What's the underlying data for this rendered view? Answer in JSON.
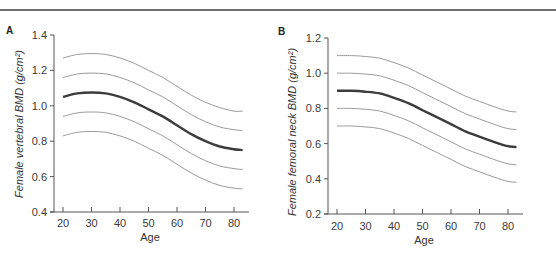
{
  "chart_data": [
    {
      "panel": "A",
      "type": "line",
      "title": "",
      "xlabel": "Age",
      "ylabel": "Female vertebral BMD (g/cm²)",
      "xlim": [
        17,
        85
      ],
      "ylim": [
        0.4,
        1.4
      ],
      "x_ticks": [
        20,
        30,
        40,
        50,
        60,
        70,
        80
      ],
      "y_ticks": [
        "0.4",
        "0.6",
        "0.8",
        "1.0",
        "1.2",
        "1.4"
      ],
      "grid": false,
      "legend": null,
      "x": [
        20,
        25,
        30,
        35,
        40,
        45,
        50,
        55,
        60,
        65,
        70,
        75,
        80,
        83
      ],
      "series": [
        {
          "name": "+2 SD",
          "style": "thin-gray",
          "values": [
            1.27,
            1.29,
            1.295,
            1.29,
            1.27,
            1.24,
            1.2,
            1.16,
            1.11,
            1.06,
            1.02,
            0.99,
            0.97,
            0.97
          ]
        },
        {
          "name": "+1 SD",
          "style": "thin-gray",
          "values": [
            1.16,
            1.18,
            1.185,
            1.18,
            1.16,
            1.13,
            1.09,
            1.05,
            1.0,
            0.95,
            0.91,
            0.88,
            0.865,
            0.86
          ]
        },
        {
          "name": "Mean",
          "style": "thick-dark",
          "values": [
            1.05,
            1.07,
            1.075,
            1.07,
            1.05,
            1.02,
            0.98,
            0.94,
            0.89,
            0.84,
            0.8,
            0.77,
            0.755,
            0.75
          ]
        },
        {
          "name": "-1 SD",
          "style": "thin-gray",
          "values": [
            0.94,
            0.96,
            0.965,
            0.96,
            0.94,
            0.91,
            0.87,
            0.83,
            0.78,
            0.73,
            0.69,
            0.66,
            0.645,
            0.64
          ]
        },
        {
          "name": "-2 SD",
          "style": "thin-gray",
          "values": [
            0.83,
            0.85,
            0.855,
            0.85,
            0.83,
            0.8,
            0.76,
            0.72,
            0.67,
            0.62,
            0.58,
            0.55,
            0.535,
            0.53
          ]
        }
      ]
    },
    {
      "panel": "B",
      "type": "line",
      "title": "",
      "xlabel": "Age",
      "ylabel": "Female femoral neck BMD (g/cm²)",
      "xlim": [
        17,
        85
      ],
      "ylim": [
        0.2,
        1.2
      ],
      "x_ticks": [
        20,
        30,
        40,
        50,
        60,
        70,
        80
      ],
      "y_ticks": [
        "0.2",
        "0.4",
        "0.6",
        "0.8",
        "1.0",
        "1.2"
      ],
      "grid": false,
      "legend": null,
      "x": [
        20,
        25,
        30,
        35,
        40,
        45,
        50,
        55,
        60,
        65,
        70,
        75,
        80,
        83
      ],
      "series": [
        {
          "name": "+2 SD",
          "style": "thin-gray",
          "values": [
            1.1,
            1.1,
            1.095,
            1.085,
            1.06,
            1.03,
            0.99,
            0.95,
            0.91,
            0.87,
            0.84,
            0.81,
            0.785,
            0.78
          ]
        },
        {
          "name": "+1 SD",
          "style": "thin-gray",
          "values": [
            1.0,
            1.0,
            0.995,
            0.985,
            0.96,
            0.93,
            0.89,
            0.85,
            0.81,
            0.77,
            0.74,
            0.71,
            0.685,
            0.68
          ]
        },
        {
          "name": "Mean",
          "style": "thick-dark",
          "values": [
            0.9,
            0.9,
            0.895,
            0.885,
            0.86,
            0.83,
            0.79,
            0.75,
            0.71,
            0.67,
            0.64,
            0.61,
            0.585,
            0.58
          ]
        },
        {
          "name": "-1 SD",
          "style": "thin-gray",
          "values": [
            0.8,
            0.8,
            0.795,
            0.785,
            0.76,
            0.73,
            0.69,
            0.65,
            0.61,
            0.57,
            0.54,
            0.51,
            0.485,
            0.48
          ]
        },
        {
          "name": "-2 SD",
          "style": "thin-gray",
          "values": [
            0.7,
            0.7,
            0.695,
            0.685,
            0.66,
            0.63,
            0.59,
            0.55,
            0.51,
            0.47,
            0.44,
            0.41,
            0.385,
            0.38
          ]
        }
      ]
    }
  ],
  "colors": {
    "mean_line": "#3c3c3c",
    "sd_line": "#9a9a9a",
    "axis": "#555555",
    "rule": "#6e6e6e"
  }
}
